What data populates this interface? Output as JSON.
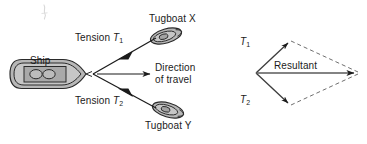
{
  "figure": {
    "type": "physics-vector-diagram",
    "background_color": "#ffffff",
    "line_color": "#1b1b1b",
    "hull_fill": "#b5b5b5",
    "hull_inner_fill": "#c9c9c9",
    "deck_fill": "#a8a8a8",
    "stray_mark_color": "#c4c4c4"
  },
  "left_diagram": {
    "name": "ship-and-tugboats",
    "labels": {
      "ship": "Ship",
      "tension_1_prefix": "Tension ",
      "tension_1_symbol": "T",
      "tension_1_sub": "1",
      "tension_2_prefix": "Tension ",
      "tension_2_symbol": "T",
      "tension_2_sub": "2",
      "tugboat_x": "Tugboat X",
      "tugboat_y": "Tugboat Y",
      "direction_line1": "Direction",
      "direction_line2": "of travel"
    }
  },
  "right_diagram": {
    "name": "force-parallelogram",
    "labels": {
      "t1_symbol": "T",
      "t1_sub": "1",
      "t2_symbol": "T",
      "t2_sub": "2",
      "resultant": "Resultant"
    },
    "vectors": [
      {
        "name": "T1",
        "from": [
          256,
          73
        ],
        "to": [
          290,
          41
        ],
        "style": "solid"
      },
      {
        "name": "T2",
        "from": [
          256,
          73
        ],
        "to": [
          290,
          105
        ],
        "style": "solid"
      },
      {
        "name": "Resultant",
        "from": [
          256,
          73
        ],
        "to": [
          357,
          73
        ],
        "style": "solid"
      },
      {
        "name": "T1-parallel",
        "from": [
          290,
          41
        ],
        "to": [
          357,
          73
        ],
        "style": "dashed"
      },
      {
        "name": "T2-parallel",
        "from": [
          290,
          105
        ],
        "to": [
          357,
          73
        ],
        "style": "dashed"
      }
    ]
  }
}
